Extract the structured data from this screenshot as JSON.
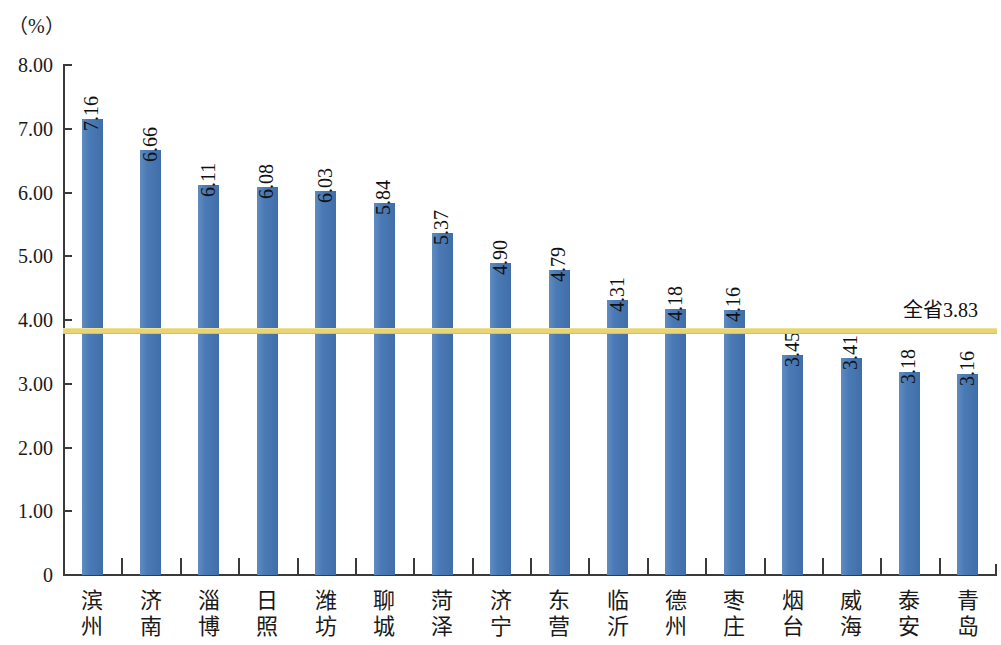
{
  "chart_data": {
    "type": "bar",
    "title": "",
    "subtitle": "",
    "unit_label": "（%）",
    "xlabel": "",
    "ylabel": "",
    "ylim": [
      0,
      8
    ],
    "grid": false,
    "legend": null,
    "categories": [
      "滨州",
      "济南",
      "淄博",
      "日照",
      "潍坊",
      "聊城",
      "菏泽",
      "济宁",
      "东营",
      "临沂",
      "德州",
      "枣庄",
      "烟台",
      "威海",
      "泰安",
      "青岛"
    ],
    "values": [
      7.16,
      6.66,
      6.11,
      6.08,
      6.03,
      5.84,
      5.37,
      4.9,
      4.79,
      4.31,
      4.18,
      4.16,
      3.45,
      3.41,
      3.18,
      3.16
    ],
    "value_labels": [
      "7.16",
      "6.66",
      "6.11",
      "6.08",
      "6.03",
      "5.84",
      "5.37",
      "4.90",
      "4.79",
      "4.31",
      "4.18",
      "4.16",
      "3.45",
      "3.41",
      "3.18",
      "3.16"
    ],
    "y_ticks": [
      "8.00",
      "7.00",
      "6.00",
      "5.00",
      "4.00",
      "3.00",
      "2.00",
      "1.00",
      "0"
    ],
    "y_tick_values": [
      8,
      7,
      6,
      5,
      4,
      3,
      2,
      1,
      0
    ],
    "reference_line": {
      "label": "全省3.83",
      "value": 3.83,
      "color": "#e8d473"
    },
    "colors": {
      "bar": "#4a7ab5",
      "axis": "#3a3a3a",
      "text": "#1a1a1a",
      "reference": "#e8d473"
    }
  }
}
